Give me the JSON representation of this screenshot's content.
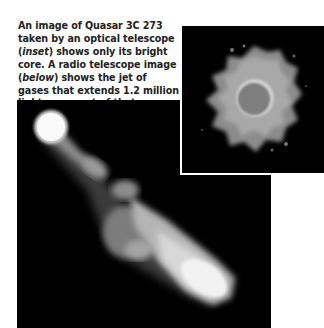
{
  "caption": {
    "part1": "An image of Quasar 3C 273 taken by an optical telescope (",
    "inset_word": "inset",
    "part2": ") shows only its bright core. A radio telescope image (",
    "below_word": "below",
    "part3": ") shows the jet of gases that extends 1.2 million light-years out of that core."
  },
  "images": {
    "radio": {
      "description": "Radio telescope image of Quasar 3C 273 showing bright core and extended jet",
      "background": "#000000"
    },
    "inset": {
      "description": "Optical telescope image of Quasar 3C 273 showing bright fuzzy core",
      "border_color": "#ffffff",
      "background": "#000000"
    }
  }
}
